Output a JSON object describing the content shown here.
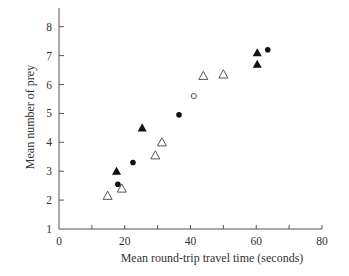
{
  "chart_data": {
    "type": "scatter",
    "title": "",
    "xlabel": "Mean round-trip travel time (seconds)",
    "ylabel": "Mean number of prey",
    "xlim": [
      0,
      80
    ],
    "ylim": [
      1,
      8.7
    ],
    "x_ticks": [
      0,
      20,
      40,
      60,
      80
    ],
    "x_minor_ticks": [
      10,
      30,
      50,
      70
    ],
    "y_ticks": [
      1,
      2,
      3,
      4,
      5,
      6,
      7,
      8
    ],
    "grid": false,
    "legend": null,
    "series": [
      {
        "name": "filled-triangle",
        "marker": "triangle-filled",
        "points": [
          [
            17.5,
            3.0
          ],
          [
            25.3,
            4.5
          ],
          [
            60.3,
            7.1
          ],
          [
            60.3,
            6.7
          ]
        ]
      },
      {
        "name": "open-triangle",
        "marker": "triangle-open",
        "points": [
          [
            14.8,
            2.15
          ],
          [
            19.1,
            2.4
          ],
          [
            29.3,
            3.55
          ],
          [
            31.3,
            4.0
          ],
          [
            43.9,
            6.3
          ],
          [
            50.0,
            6.35
          ]
        ]
      },
      {
        "name": "filled-circle",
        "marker": "circle-filled",
        "points": [
          [
            17.9,
            2.55
          ],
          [
            22.5,
            3.3
          ],
          [
            36.5,
            4.95
          ],
          [
            63.5,
            7.2
          ]
        ]
      },
      {
        "name": "open-circle",
        "marker": "circle-open",
        "points": [
          [
            41.0,
            5.6
          ]
        ]
      }
    ]
  },
  "labels": {
    "xlabel": "Mean round-trip travel time (seconds)",
    "ylabel": "Mean number of prey"
  }
}
